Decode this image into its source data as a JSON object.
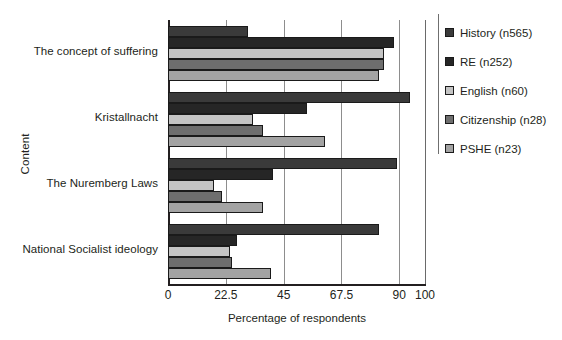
{
  "chart_data": {
    "type": "bar",
    "orientation": "horizontal",
    "title": "",
    "xlabel": "Percentage of respondents",
    "ylabel": "Content",
    "xlim": [
      0,
      100
    ],
    "xticks": [
      0,
      22.5,
      45,
      67.5,
      90,
      100
    ],
    "xtick_labels": [
      "0",
      "22.5",
      "45",
      "67.5",
      "90",
      "100"
    ],
    "grid": true,
    "grid_axis": "x",
    "legend_position": "right",
    "categories": [
      "The concept of suffering",
      "Kristallnacht",
      "The Nuremberg Laws",
      "National Socialist ideology"
    ],
    "series": [
      {
        "name": "History (n565)",
        "color": "#3a3a3a",
        "values": [
          31,
          94,
          89,
          82
        ]
      },
      {
        "name": "RE (n252)",
        "color": "#262626",
        "values": [
          88,
          54,
          41,
          27
        ]
      },
      {
        "name": "English (n60)",
        "color": "#c4c4c4",
        "values": [
          84,
          33,
          18,
          24
        ]
      },
      {
        "name": "Citizenship (n28)",
        "color": "#6e6e6e",
        "values": [
          84,
          37,
          21,
          25
        ]
      },
      {
        "name": "PSHE (n23)",
        "color": "#a3a3a3",
        "values": [
          82,
          61,
          37,
          40
        ]
      }
    ]
  },
  "legend": {
    "items": [
      {
        "label": "History (n565)",
        "color": "#3a3a3a"
      },
      {
        "label": "RE (n252)",
        "color": "#262626"
      },
      {
        "label": "English (n60)",
        "color": "#c4c4c4"
      },
      {
        "label": "Citizenship (n28)",
        "color": "#6e6e6e"
      },
      {
        "label": "PSHE (n23)",
        "color": "#a3a3a3"
      }
    ]
  }
}
